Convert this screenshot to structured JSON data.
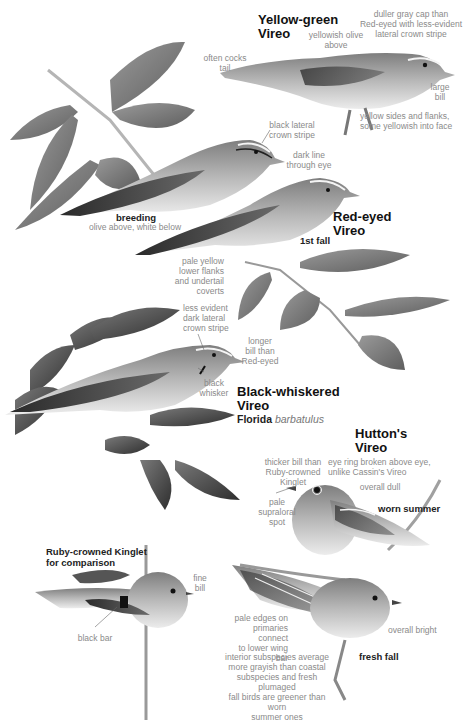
{
  "species": {
    "yellow_green": {
      "title": "Yellow-green\nVireo",
      "labels": {
        "cap": "duller gray cap than\nRed-eyed with less-evident\nlateral crown stripe",
        "above": "yellowish olive\nabove",
        "tail": "often cocks\ntail",
        "bill": "large\nbill",
        "sides": "yellow sides and flanks,\nsome yellowish into face"
      }
    },
    "red_eyed": {
      "title": "Red-eyed\nVireo",
      "breeding": {
        "plumage": "breeding",
        "note": "olive above, white below",
        "crown": "black lateral\ncrown stripe",
        "eye": "dark line\nthrough eye"
      },
      "first_fall": {
        "plumage": "1st fall",
        "flanks": "pale yellow\nlower flanks\nand undertail\ncoverts"
      }
    },
    "black_whiskered": {
      "title": "Black-whiskered\nVireo",
      "subspecies_region": "Florida",
      "subspecies_name": "barbatulus",
      "labels": {
        "crown": "less evident\ndark lateral\ncrown stripe",
        "bill": "longer\nbill than\nRed-eyed",
        "whisker": "black\nwhisker"
      }
    },
    "huttons": {
      "title": "Hutton's\nVireo",
      "worn_summer": {
        "plumage": "worn summer",
        "bill": "thicker bill than\nRuby-crowned\nKinglet",
        "eyering": "eye ring broken above eye,\nunlike Cassin's Vireo",
        "dull": "overall dull",
        "spot": "pale\nsupraloral\nspot"
      },
      "fresh_fall": {
        "plumage": "fresh fall",
        "edges": "pale edges on\nprimaries connect\nto lower wing bar",
        "bright": "overall bright",
        "interior": "interior subspecies average\nmore grayish than coastal\nsubspecies and fresh plumaged\nfall birds are greener than worn\nsummer ones"
      }
    },
    "kinglet": {
      "title": "Ruby-crowned Kinglet\nfor comparison",
      "labels": {
        "bill": "fine\nbill",
        "bar": "black bar"
      }
    }
  },
  "colors": {
    "ink": "#111111",
    "annotation": "#8a8a8a",
    "background": "#ffffff"
  }
}
